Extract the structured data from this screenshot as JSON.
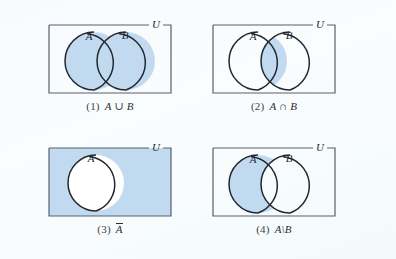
{
  "figure": {
    "background_color": "#f7fbfd",
    "fill_color": "#c2daf0",
    "stroke_color": "#23282f",
    "rect_stroke_color": "#56606c",
    "universe_label": "U",
    "set_a_label": "A",
    "set_b_label": "B"
  },
  "panels": [
    {
      "id": "union",
      "index": "(1)",
      "caption": "A ∪ B",
      "caption_plain": "A union B",
      "universe_label": "U",
      "labels": [
        "A",
        "B"
      ],
      "shaded_region": "both-circles",
      "circle_count": 2
    },
    {
      "id": "intersection",
      "index": "(2)",
      "caption": "A ∩ B",
      "caption_plain": "A intersect B",
      "universe_label": "U",
      "labels": [
        "A",
        "B"
      ],
      "shaded_region": "lens-overlap",
      "circle_count": 2
    },
    {
      "id": "complement",
      "index": "(3)",
      "caption": "A",
      "caption_overline": true,
      "caption_plain": "complement of A",
      "universe_label": "U",
      "labels": [
        "A"
      ],
      "shaded_region": "rectangle-minus-circle",
      "circle_count": 1
    },
    {
      "id": "difference",
      "index": "(4)",
      "caption": "A\\B",
      "caption_plain": "A minus B",
      "universe_label": "U",
      "labels": [
        "A",
        "B"
      ],
      "shaded_region": "a-minus-b",
      "circle_count": 2
    }
  ]
}
